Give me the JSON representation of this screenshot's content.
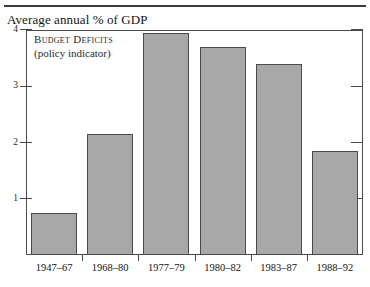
{
  "figure": {
    "title": "Average annual % of GDP",
    "annotation": {
      "line1": "Budget Deficits",
      "line2": "(policy indicator)"
    },
    "bar_color": "#a8a8a8",
    "border_color": "#4a4a4a"
  },
  "chart_data": {
    "type": "bar",
    "title": "Average annual % of GDP",
    "xlabel": "",
    "ylabel": "Average annual % of GDP",
    "categories": [
      "1947–67",
      "1968–80",
      "1977–79",
      "1980–82",
      "1983–87",
      "1988–92"
    ],
    "values": [
      0.75,
      2.15,
      3.95,
      3.7,
      3.4,
      1.85
    ],
    "series": [
      {
        "name": "Budget Deficits (policy indicator)",
        "values": [
          0.75,
          2.15,
          3.95,
          3.7,
          3.4,
          1.85
        ]
      }
    ],
    "ylim": [
      0,
      4
    ],
    "yticks": [
      1,
      2,
      3,
      4
    ],
    "ytick_labels": [
      "1",
      "2",
      "3",
      "4"
    ],
    "grid": false,
    "legend": "none",
    "annotations": [
      "Budget Deficits",
      "(policy indicator)"
    ]
  }
}
